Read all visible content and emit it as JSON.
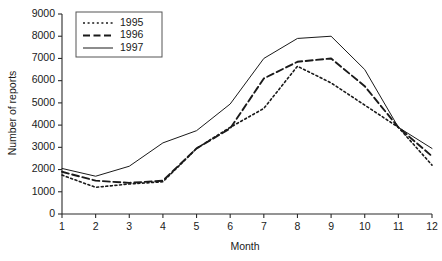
{
  "chart_data": {
    "type": "line",
    "title": "",
    "xlabel": "Month",
    "ylabel": "Number of reports",
    "categories": [
      "1",
      "2",
      "3",
      "4",
      "5",
      "6",
      "7",
      "8",
      "9",
      "10",
      "11",
      "12"
    ],
    "x": [
      1,
      2,
      3,
      4,
      5,
      6,
      7,
      8,
      9,
      10,
      11,
      12
    ],
    "xlim": [
      1,
      12
    ],
    "ylim": [
      0,
      9000
    ],
    "ytick_labels": [
      "0",
      "1000",
      "2000",
      "3000",
      "4000",
      "5000",
      "6000",
      "7000",
      "8000",
      "9000"
    ],
    "yticks": [
      0,
      1000,
      2000,
      3000,
      4000,
      5000,
      6000,
      7000,
      8000,
      9000
    ],
    "xtick_labels": [
      "1",
      "2",
      "3",
      "4",
      "5",
      "6",
      "7",
      "8",
      "9",
      "10",
      "11",
      "12"
    ],
    "grid": false,
    "legend_position": "top-left",
    "series": [
      {
        "name": "1995",
        "style": "dotted",
        "dash": "2,2.6",
        "width": 1.6,
        "values": [
          1750,
          1200,
          1350,
          1450,
          2950,
          3900,
          4750,
          6650,
          5900,
          4900,
          3900,
          2200
        ]
      },
      {
        "name": "1996",
        "style": "dashed",
        "dash": "7,3.5",
        "width": 1.9,
        "values": [
          1900,
          1500,
          1400,
          1500,
          2950,
          3850,
          6100,
          6850,
          7000,
          5750,
          3900,
          2600
        ]
      },
      {
        "name": "1997",
        "style": "solid",
        "dash": "",
        "width": 1.0,
        "values": [
          2050,
          1700,
          2150,
          3200,
          3750,
          4950,
          7000,
          7900,
          8000,
          6500,
          3900,
          2950
        ]
      }
    ],
    "colors": {
      "line": "#1a1a1a",
      "axis": "#2b2b2b",
      "background": "#ffffff"
    }
  }
}
